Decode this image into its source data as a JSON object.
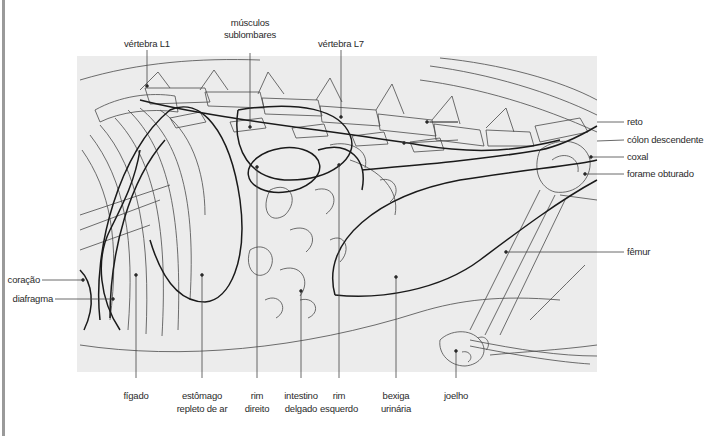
{
  "figure": {
    "background": "#ffffff",
    "panel_fill": "#ececec",
    "line_color": "#3a3a3a",
    "outline_color": "#1a1a1a",
    "leader_color": "#444444"
  },
  "labels": {
    "top": [
      {
        "id": "vertebra-l1",
        "text": "vértebra L1"
      },
      {
        "id": "musculos-sublombares",
        "line1": "músculos",
        "line2": "sublombares"
      },
      {
        "id": "vertebra-l7",
        "text": "vértebra L7"
      }
    ],
    "right": [
      {
        "id": "reto",
        "text": "reto"
      },
      {
        "id": "colon-descendente",
        "text": "cólon descendente"
      },
      {
        "id": "coxal",
        "text": "coxal"
      },
      {
        "id": "forame-obturado",
        "text": "forame obturado"
      },
      {
        "id": "femur",
        "text": "fêmur"
      }
    ],
    "left": [
      {
        "id": "coracao",
        "text": "coração"
      },
      {
        "id": "diafragma",
        "text": "diafragma"
      }
    ],
    "bottom": [
      {
        "id": "figado",
        "line1": "fígado",
        "line2": ""
      },
      {
        "id": "estomago",
        "line1": "estômago",
        "line2": "repleto de ar"
      },
      {
        "id": "rim-direito",
        "line1": "rim",
        "line2": "direito"
      },
      {
        "id": "intestino-delgado",
        "line1": "intestino",
        "line2": "delgado"
      },
      {
        "id": "rim-esquerdo",
        "line1": "rim",
        "line2": "esquerdo"
      },
      {
        "id": "bexiga-urinaria",
        "line1": "bexiga",
        "line2": "urinária"
      },
      {
        "id": "joelho",
        "line1": "joelho",
        "line2": ""
      }
    ]
  }
}
